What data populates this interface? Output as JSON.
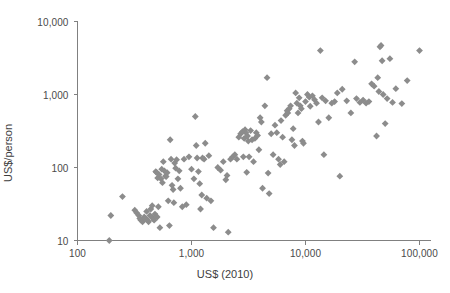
{
  "chart_data": {
    "type": "scatter",
    "title": "",
    "xlabel": "US$ (2010)",
    "ylabel": "US$/person",
    "xscale": "log",
    "yscale": "log",
    "xlim": [
      100,
      150000
    ],
    "ylim": [
      10,
      10000
    ],
    "xticks": [
      100,
      1000,
      10000,
      100000
    ],
    "xtick_labels": [
      "100",
      "1,000",
      "10,000",
      "100,000"
    ],
    "yticks": [
      10,
      100,
      1000,
      10000
    ],
    "ytick_labels": [
      "10",
      "100",
      "1,000",
      "10,000"
    ],
    "grid": false,
    "legend": null,
    "marker": "diamond",
    "marker_color": "#8c8c8c",
    "axis_color": "#808080",
    "points": [
      [
        190,
        10
      ],
      [
        196,
        22
      ],
      [
        248,
        40
      ],
      [
        318,
        26
      ],
      [
        330,
        24
      ],
      [
        345,
        22
      ],
      [
        352,
        20
      ],
      [
        360,
        19
      ],
      [
        372,
        18
      ],
      [
        385,
        21
      ],
      [
        395,
        20
      ],
      [
        404,
        25
      ],
      [
        412,
        19
      ],
      [
        420,
        18
      ],
      [
        432,
        22
      ],
      [
        440,
        27
      ],
      [
        452,
        30
      ],
      [
        460,
        20
      ],
      [
        470,
        19
      ],
      [
        478,
        23
      ],
      [
        486,
        88
      ],
      [
        492,
        86
      ],
      [
        500,
        21
      ],
      [
        505,
        72
      ],
      [
        512,
        29
      ],
      [
        520,
        80
      ],
      [
        528,
        15
      ],
      [
        540,
        70
      ],
      [
        548,
        95
      ],
      [
        556,
        62
      ],
      [
        566,
        120
      ],
      [
        578,
        90
      ],
      [
        590,
        76
      ],
      [
        600,
        75
      ],
      [
        612,
        85
      ],
      [
        625,
        35
      ],
      [
        640,
        16
      ],
      [
        650,
        240
      ],
      [
        662,
        130
      ],
      [
        675,
        57
      ],
      [
        690,
        50
      ],
      [
        700,
        33
      ],
      [
        712,
        115
      ],
      [
        726,
        98
      ],
      [
        740,
        128
      ],
      [
        760,
        70
      ],
      [
        780,
        90
      ],
      [
        800,
        52
      ],
      [
        830,
        29
      ],
      [
        860,
        130
      ],
      [
        900,
        31
      ],
      [
        950,
        140
      ],
      [
        1000,
        95
      ],
      [
        1050,
        70
      ],
      [
        1080,
        500
      ],
      [
        1100,
        200
      ],
      [
        1120,
        135
      ],
      [
        1150,
        88
      ],
      [
        1180,
        60
      ],
      [
        1200,
        27
      ],
      [
        1230,
        42
      ],
      [
        1250,
        135
      ],
      [
        1290,
        130
      ],
      [
        1320,
        215
      ],
      [
        1360,
        38
      ],
      [
        1420,
        145
      ],
      [
        1480,
        35
      ],
      [
        1560,
        15
      ],
      [
        1700,
        100
      ],
      [
        1800,
        92
      ],
      [
        1900,
        120
      ],
      [
        2000,
        68
      ],
      [
        2050,
        78
      ],
      [
        2100,
        13
      ],
      [
        2200,
        130
      ],
      [
        2300,
        140
      ],
      [
        2400,
        150
      ],
      [
        2500,
        130
      ],
      [
        2600,
        260
      ],
      [
        2700,
        290
      ],
      [
        2800,
        310
      ],
      [
        2850,
        140
      ],
      [
        2900,
        250
      ],
      [
        2950,
        330
      ],
      [
        3000,
        300
      ],
      [
        3050,
        86
      ],
      [
        3100,
        270
      ],
      [
        3150,
        230
      ],
      [
        3200,
        140
      ],
      [
        3300,
        320
      ],
      [
        3400,
        240
      ],
      [
        3500,
        120
      ],
      [
        3600,
        250
      ],
      [
        3700,
        300
      ],
      [
        3800,
        275
      ],
      [
        3900,
        175
      ],
      [
        4000,
        480
      ],
      [
        4100,
        420
      ],
      [
        4200,
        52
      ],
      [
        4400,
        700
      ],
      [
        4600,
        1700
      ],
      [
        4700,
        84
      ],
      [
        4800,
        44
      ],
      [
        5000,
        290
      ],
      [
        5200,
        150
      ],
      [
        5400,
        380
      ],
      [
        5600,
        300
      ],
      [
        5800,
        130
      ],
      [
        6000,
        110
      ],
      [
        6100,
        440
      ],
      [
        6300,
        260
      ],
      [
        6500,
        120
      ],
      [
        6700,
        520
      ],
      [
        6900,
        600
      ],
      [
        7000,
        560
      ],
      [
        7200,
        640
      ],
      [
        7400,
        700
      ],
      [
        7600,
        240
      ],
      [
        7800,
        340
      ],
      [
        8000,
        200
      ],
      [
        8200,
        1050
      ],
      [
        8400,
        760
      ],
      [
        8600,
        560
      ],
      [
        8800,
        900
      ],
      [
        9000,
        700
      ],
      [
        9200,
        640
      ],
      [
        9400,
        230
      ],
      [
        9600,
        215
      ],
      [
        10000,
        800
      ],
      [
        10400,
        1000
      ],
      [
        10800,
        920
      ],
      [
        11000,
        690
      ],
      [
        11500,
        960
      ],
      [
        12000,
        850
      ],
      [
        12500,
        760
      ],
      [
        13000,
        420
      ],
      [
        13500,
        4000
      ],
      [
        14000,
        900
      ],
      [
        14500,
        150
      ],
      [
        15000,
        820
      ],
      [
        16000,
        480
      ],
      [
        17000,
        760
      ],
      [
        18000,
        800
      ],
      [
        19000,
        1050
      ],
      [
        20000,
        76
      ],
      [
        21000,
        1180
      ],
      [
        23000,
        820
      ],
      [
        25000,
        560
      ],
      [
        27000,
        2800
      ],
      [
        28000,
        880
      ],
      [
        30000,
        780
      ],
      [
        32000,
        840
      ],
      [
        34000,
        760
      ],
      [
        36000,
        800
      ],
      [
        38000,
        1400
      ],
      [
        40000,
        1300
      ],
      [
        42000,
        270
      ],
      [
        43000,
        1700
      ],
      [
        44000,
        1100
      ],
      [
        45000,
        4500
      ],
      [
        46000,
        4700
      ],
      [
        47000,
        2900
      ],
      [
        48000,
        1000
      ],
      [
        50000,
        400
      ],
      [
        52000,
        880
      ],
      [
        55000,
        3100
      ],
      [
        58000,
        780
      ],
      [
        62000,
        1200
      ],
      [
        70000,
        750
      ],
      [
        78000,
        1550
      ],
      [
        100000,
        4000
      ]
    ]
  }
}
